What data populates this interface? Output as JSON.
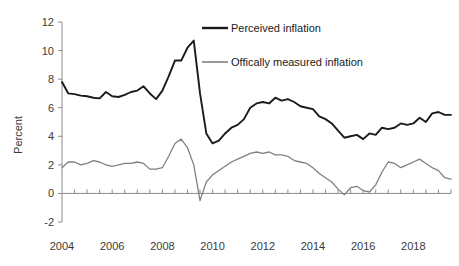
{
  "chart_data": {
    "type": "line",
    "title": "",
    "xlabel": "",
    "ylabel": "Percent",
    "xlim": [
      2004.0,
      2019.5
    ],
    "ylim": [
      -2,
      12
    ],
    "ytick_labels": [
      "12",
      "10",
      "8",
      "6",
      "4",
      "2",
      "0",
      "-2"
    ],
    "ytick_values": [
      12,
      10,
      8,
      6,
      4,
      2,
      0,
      -2
    ],
    "xtick_labels": [
      "2004",
      "2006",
      "2008",
      "2010",
      "2012",
      "2014",
      "2016",
      "2018"
    ],
    "xtick_values": [
      2004,
      2006,
      2008,
      2010,
      2012,
      2014,
      2016,
      2018
    ],
    "minor_xtick_step": 0.5,
    "grid": false,
    "legend_position": "top-right",
    "series": [
      {
        "name": "Perceived inflation",
        "color": "#1a1a1a",
        "x": [
          2004.0,
          2004.25,
          2004.5,
          2004.75,
          2005.0,
          2005.25,
          2005.5,
          2005.75,
          2006.0,
          2006.25,
          2006.5,
          2006.75,
          2007.0,
          2007.25,
          2007.5,
          2007.75,
          2008.0,
          2008.25,
          2008.5,
          2008.75,
          2009.0,
          2009.25,
          2009.5,
          2009.75,
          2010.0,
          2010.25,
          2010.5,
          2010.75,
          2011.0,
          2011.25,
          2011.5,
          2011.75,
          2012.0,
          2012.25,
          2012.5,
          2012.75,
          2013.0,
          2013.25,
          2013.5,
          2013.75,
          2014.0,
          2014.25,
          2014.5,
          2014.75,
          2015.0,
          2015.25,
          2015.5,
          2015.75,
          2016.0,
          2016.25,
          2016.5,
          2016.75,
          2017.0,
          2017.25,
          2017.5,
          2017.75,
          2018.0,
          2018.25,
          2018.5,
          2018.75,
          2019.0,
          2019.25,
          2019.5
        ],
        "y": [
          7.8,
          7.0,
          6.95,
          6.85,
          6.8,
          6.7,
          6.65,
          7.1,
          6.8,
          6.75,
          6.9,
          7.1,
          7.2,
          7.5,
          7.0,
          6.6,
          7.2,
          8.2,
          9.3,
          9.3,
          10.2,
          10.7,
          7.0,
          4.2,
          3.5,
          3.7,
          4.2,
          4.6,
          4.8,
          5.2,
          6.0,
          6.3,
          6.4,
          6.3,
          6.7,
          6.5,
          6.6,
          6.4,
          6.1,
          6.0,
          5.9,
          5.4,
          5.2,
          4.9,
          4.4,
          3.9,
          4.0,
          4.1,
          3.8,
          4.2,
          4.1,
          4.6,
          4.5,
          4.6,
          4.9,
          4.8,
          4.9,
          5.3,
          5.0,
          5.6,
          5.7,
          5.5,
          5.5
        ]
      },
      {
        "name": "Offically measured inflation",
        "color": "#808080",
        "x": [
          2004.0,
          2004.25,
          2004.5,
          2004.75,
          2005.0,
          2005.25,
          2005.5,
          2005.75,
          2006.0,
          2006.25,
          2006.5,
          2006.75,
          2007.0,
          2007.25,
          2007.5,
          2007.75,
          2008.0,
          2008.25,
          2008.5,
          2008.75,
          2009.0,
          2009.25,
          2009.5,
          2009.75,
          2010.0,
          2010.25,
          2010.5,
          2010.75,
          2011.0,
          2011.25,
          2011.5,
          2011.75,
          2012.0,
          2012.25,
          2012.5,
          2012.75,
          2013.0,
          2013.25,
          2013.5,
          2013.75,
          2014.0,
          2014.25,
          2014.5,
          2014.75,
          2015.0,
          2015.25,
          2015.5,
          2015.75,
          2016.0,
          2016.25,
          2016.5,
          2016.75,
          2017.0,
          2017.25,
          2017.5,
          2017.75,
          2018.0,
          2018.25,
          2018.5,
          2018.75,
          2019.0,
          2019.25,
          2019.5
        ],
        "y": [
          1.8,
          2.2,
          2.2,
          2.0,
          2.1,
          2.3,
          2.2,
          2.0,
          1.9,
          2.0,
          2.1,
          2.1,
          2.2,
          2.1,
          1.7,
          1.7,
          1.8,
          2.6,
          3.5,
          3.8,
          3.2,
          2.0,
          -0.5,
          0.8,
          1.3,
          1.6,
          1.9,
          2.2,
          2.4,
          2.6,
          2.8,
          2.9,
          2.8,
          2.9,
          2.7,
          2.7,
          2.6,
          2.3,
          2.2,
          2.1,
          1.8,
          1.4,
          1.1,
          0.8,
          0.3,
          -0.1,
          0.4,
          0.5,
          0.2,
          0.1,
          0.6,
          1.5,
          2.2,
          2.1,
          1.8,
          2.0,
          2.2,
          2.4,
          2.1,
          1.8,
          1.6,
          1.1,
          1.0
        ]
      }
    ]
  },
  "legend": {
    "items": [
      {
        "label": "Perceived inflation",
        "color": "#1a1a1a"
      },
      {
        "label": "Offically measured inflation",
        "color": "#808080"
      }
    ]
  },
  "axes": {
    "y_title": "Percent"
  }
}
